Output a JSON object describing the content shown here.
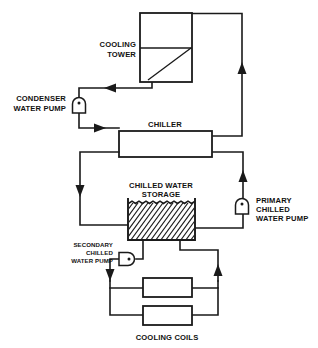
{
  "diagram": {
    "type": "hvac-schematic",
    "canvas": {
      "width": 318,
      "height": 348
    },
    "colors": {
      "line": "#1a1a1a",
      "background": "#ffffff",
      "text": "#111111"
    },
    "equipment": [
      {
        "id": "cooling-tower",
        "label_lines": [
          "COOLING",
          "TOWER"
        ],
        "label_line1": "COOLING",
        "label_line2": "TOWER",
        "shape": "box-with-divider-and-diagonal",
        "x": 140,
        "y": 13,
        "w": 52,
        "h": 69
      },
      {
        "id": "chiller",
        "label_lines": [
          "CHILLER"
        ],
        "label_line1": "CHILLER",
        "shape": "rectangle",
        "x": 119,
        "y": 131,
        "w": 93,
        "h": 26
      },
      {
        "id": "chilled-water-storage",
        "label_lines": [
          "CHILLED WATER",
          "STORAGE"
        ],
        "label_line1": "CHILLED WATER",
        "label_line2": "STORAGE",
        "shape": "hatched-tank-open-top",
        "x": 128,
        "y": 202,
        "w": 67,
        "h": 38
      },
      {
        "id": "cooling-coils",
        "label_lines": [
          "COOLING COILS"
        ],
        "label_line1": "COOLING COILS",
        "shape": "two-parallel-boxes",
        "coil1": {
          "x": 143,
          "y": 278,
          "w": 49,
          "h": 19
        },
        "coil2": {
          "x": 143,
          "y": 306,
          "w": 49,
          "h": 19
        }
      }
    ],
    "pumps": [
      {
        "id": "condenser-water-pump",
        "label_lines": [
          "CONDENSER",
          "WATER PUMP"
        ],
        "label_line1": "CONDENSER",
        "label_line2": "WATER PUMP",
        "orientation": "vertical",
        "cx": 79,
        "cy": 104
      },
      {
        "id": "primary-chilled-water-pump",
        "label_lines": [
          "PRIMARY",
          "CHILLED",
          "WATER PUMP"
        ],
        "label_line1": "PRIMARY",
        "label_line2": "CHILLED",
        "label_line3": "WATER PUMP",
        "orientation": "vertical",
        "cx": 242,
        "cy": 205
      },
      {
        "id": "secondary-chilled-water-pump",
        "label_lines": [
          "SECONDARY",
          "CHILLED",
          "WATER PUMP"
        ],
        "label_line1": "SECONDARY",
        "label_line2": "CHILLED",
        "label_line3": "WATER PUMP",
        "orientation": "horizontal",
        "cx": 128,
        "cy": 259
      }
    ],
    "flow_arrows": [
      {
        "id": "arrow-tower-return",
        "direction": "left",
        "x": 112,
        "y": 87
      },
      {
        "id": "arrow-to-chiller",
        "direction": "right",
        "x": 95,
        "y": 128
      },
      {
        "id": "arrow-condenser-riser",
        "direction": "up",
        "x": 242,
        "y": 68
      },
      {
        "id": "arrow-primary-riser",
        "direction": "up",
        "x": 242,
        "y": 176
      },
      {
        "id": "arrow-secondary-supply",
        "direction": "down",
        "x": 80,
        "y": 190
      },
      {
        "id": "arrow-coil-supply",
        "direction": "down",
        "x": 110,
        "y": 272
      },
      {
        "id": "arrow-coil-return",
        "direction": "up",
        "x": 218,
        "y": 272
      }
    ]
  }
}
